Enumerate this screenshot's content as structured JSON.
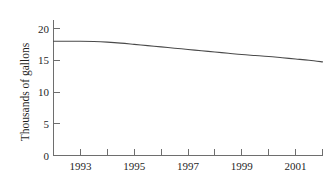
{
  "chart_data": {
    "type": "line",
    "title": "",
    "xlabel": "",
    "ylabel": "Thousands of gallons",
    "xlim": [
      1992,
      2002
    ],
    "ylim": [
      0,
      21.5
    ],
    "grid": false,
    "legend": null,
    "xticks": [
      1992,
      1993,
      1994,
      1995,
      1996,
      1997,
      1998,
      1999,
      2000,
      2001,
      2002
    ],
    "xtick_labels": [
      "",
      "1993",
      "",
      "1995",
      "",
      "1997",
      "",
      "1999",
      "",
      "2001",
      ""
    ],
    "yticks": [
      0,
      5,
      10,
      15,
      20
    ],
    "ytick_labels": [
      "0",
      "5",
      "10",
      "15",
      "20"
    ],
    "series": [
      {
        "name": "gallons",
        "color": "#4a4a4a",
        "x": [
          1992,
          1992.5,
          1993,
          1993.5,
          1994,
          1994.5,
          1995,
          1995.5,
          1996,
          1996.5,
          1997,
          1997.5,
          1998,
          1998.5,
          1999,
          1999.5,
          2000,
          2000.5,
          2001,
          2001.5,
          2002
        ],
        "values": [
          18.0,
          18.0,
          18.0,
          17.95,
          17.85,
          17.7,
          17.5,
          17.3,
          17.1,
          16.9,
          16.7,
          16.5,
          16.3,
          16.1,
          15.9,
          15.75,
          15.6,
          15.4,
          15.2,
          15.0,
          14.75
        ]
      }
    ]
  },
  "axis_labels": {
    "y_title": "Thousands of gallons"
  },
  "colors": {
    "line": "#4a4a4a",
    "axis": "#6e6e6e",
    "text": "#1f1f1f",
    "background": "#ffffff"
  }
}
